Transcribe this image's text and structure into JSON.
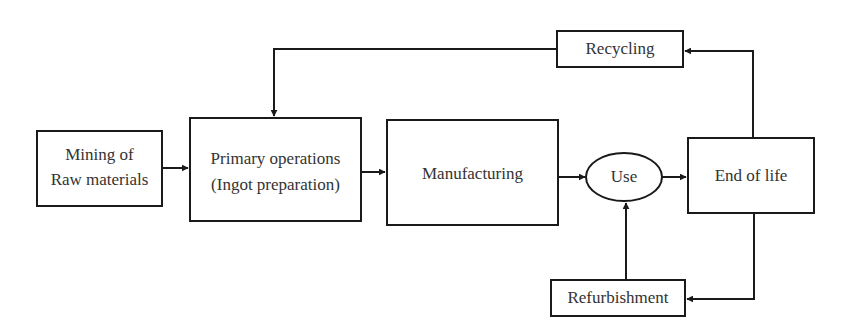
{
  "diagram": {
    "type": "flowchart",
    "nodes": {
      "mining": {
        "lines": [
          "Mining of",
          "Raw materials"
        ],
        "shape": "rect"
      },
      "primary": {
        "lines": [
          "Primary operations",
          "(Ingot preparation)"
        ],
        "shape": "rect"
      },
      "manufacturing": {
        "label": "Manufacturing",
        "shape": "rect"
      },
      "use": {
        "label": "Use",
        "shape": "ellipse"
      },
      "end_of_life": {
        "label": "End of life",
        "shape": "rect"
      },
      "recycling": {
        "label": "Recycling",
        "shape": "rect"
      },
      "refurbishment": {
        "label": "Refurbishment",
        "shape": "rect"
      }
    },
    "edges": [
      {
        "from": "Mining of Raw materials",
        "to": "Primary operations (Ingot preparation)"
      },
      {
        "from": "Primary operations (Ingot preparation)",
        "to": "Manufacturing"
      },
      {
        "from": "Manufacturing",
        "to": "Use"
      },
      {
        "from": "Use",
        "to": "End of life"
      },
      {
        "from": "End of life",
        "to": "Recycling"
      },
      {
        "from": "Recycling",
        "to": "Primary operations (Ingot preparation)"
      },
      {
        "from": "End of life",
        "to": "Refurbishment"
      },
      {
        "from": "Refurbishment",
        "to": "Use"
      }
    ],
    "colors": {
      "stroke": "#1a1a1a",
      "text": "#333333",
      "background": "#ffffff"
    }
  }
}
